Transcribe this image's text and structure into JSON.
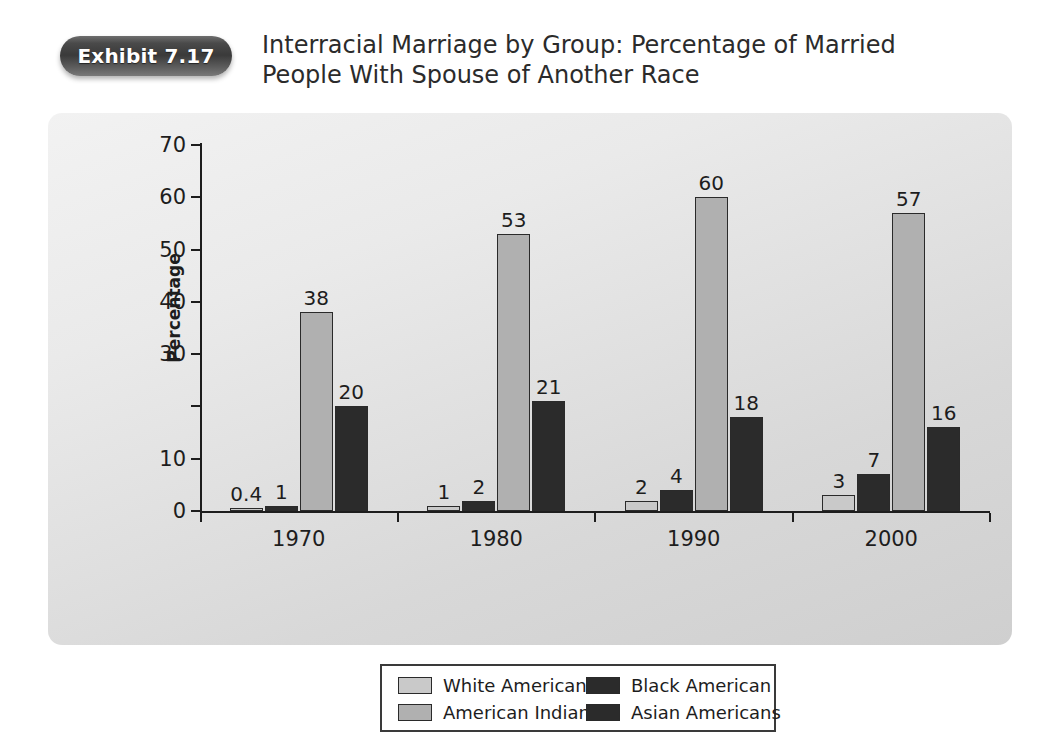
{
  "exhibit": {
    "badge_label": "Exhibit 7.17",
    "title_line1": "Interracial Marriage by Group: Percentage of Married",
    "title_line2": "People With Spouse of Another Race"
  },
  "colors": {
    "page_background": "#ffffff",
    "panel_background": "#e4e4e4",
    "axis": "#1d1d1d",
    "series_white_americans": "#c9c9c9",
    "series_american_indians": "#b0b0b0",
    "series_black_american": "#2b2b2b",
    "series_asian_americans": "#2b2b2b",
    "badge_background": "#3a3a3a",
    "badge_text": "#ffffff"
  },
  "chart_data": {
    "type": "bar",
    "title": "Interracial Marriage by Group: Percentage of Married People With Spouse of Another Race",
    "xlabel": "",
    "ylabel": "Percentage",
    "categories": [
      "1970",
      "1980",
      "1990",
      "2000"
    ],
    "ylim": [
      0,
      70
    ],
    "yticks": [
      0,
      10,
      20,
      30,
      40,
      50,
      60,
      70
    ],
    "ytick_labels": [
      "0",
      "10",
      "20",
      "30",
      "40",
      "50",
      "60",
      "70"
    ],
    "grid": false,
    "legend_position": "bottom",
    "series": [
      {
        "name": "White Americans",
        "color": "#c9c9c9",
        "values": [
          0.4,
          1,
          2,
          3
        ],
        "labels": [
          "0.4",
          "1",
          "2",
          "3"
        ]
      },
      {
        "name": "Black American",
        "color": "#2b2b2b",
        "values": [
          1,
          2,
          4,
          7
        ],
        "labels": [
          "1",
          "2",
          "4",
          "7"
        ]
      },
      {
        "name": "American Indians",
        "color": "#b0b0b0",
        "values": [
          38,
          53,
          60,
          57
        ],
        "labels": [
          "38",
          "53",
          "60",
          "57"
        ]
      },
      {
        "name": "Asian Americans",
        "color": "#2b2b2b",
        "values": [
          20,
          21,
          18,
          16
        ],
        "labels": [
          "20",
          "21",
          "18",
          "16"
        ]
      }
    ]
  },
  "legend": {
    "left_column": [
      {
        "label": "White Americans",
        "color": "#c9c9c9"
      },
      {
        "label": "American Indians",
        "color": "#b0b0b0"
      }
    ],
    "right_column": [
      {
        "label": "Black American",
        "color": "#2b2b2b"
      },
      {
        "label": "Asian Americans",
        "color": "#2b2b2b"
      }
    ]
  }
}
